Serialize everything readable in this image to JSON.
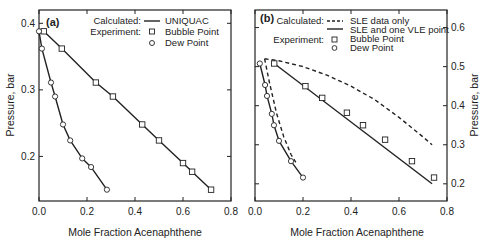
{
  "figure": {
    "background": "#ffffff",
    "ink_color": "#222222"
  },
  "chart_data": [
    {
      "panel_label": "(a)",
      "type": "line",
      "xlabel": "Mole Fraction Acenaphthene",
      "ylabel": "Pressure, bar",
      "ylabel_side": "left",
      "xlim": [
        0.0,
        0.8
      ],
      "ylim": [
        0.133,
        0.42
      ],
      "xticks": [
        0.0,
        0.2,
        0.4,
        0.6,
        0.8
      ],
      "xtick_labels": [
        "0.0",
        "0.2",
        "0.4",
        "0.6",
        "0.8"
      ],
      "yticks": [
        0.2,
        0.3,
        0.4
      ],
      "ytick_labels": [
        "0.2",
        "0.3",
        "0.4"
      ],
      "grid": false,
      "legend": {
        "position": "upper right",
        "rows": [
          {
            "group": "Calculated:",
            "symbol": "solid-line",
            "label": "UNIQUAC"
          },
          {
            "group": "Experiment:",
            "symbol": "square",
            "label": "Bubble Point"
          },
          {
            "group": "",
            "symbol": "circle",
            "label": "Dew Point"
          }
        ]
      },
      "series": [
        {
          "name": "Calculated UNIQUAC bubble curve",
          "style": "solid",
          "x": [
            0.0,
            0.02,
            0.095,
            0.237,
            0.308,
            0.43,
            0.5,
            0.6,
            0.638,
            0.717
          ],
          "y": [
            0.388,
            0.388,
            0.362,
            0.311,
            0.29,
            0.248,
            0.224,
            0.19,
            0.177,
            0.15
          ]
        },
        {
          "name": "Calculated UNIQUAC dew curve",
          "style": "solid",
          "x": [
            0.0,
            0.012,
            0.05,
            0.067,
            0.1,
            0.13,
            0.18,
            0.217,
            0.283
          ],
          "y": [
            0.388,
            0.362,
            0.311,
            0.29,
            0.248,
            0.224,
            0.197,
            0.184,
            0.15
          ]
        },
        {
          "name": "Bubble Point",
          "style": "marker-square",
          "x": [
            0.02,
            0.095,
            0.237,
            0.308,
            0.43,
            0.5,
            0.6,
            0.638,
            0.717
          ],
          "y": [
            0.388,
            0.362,
            0.311,
            0.29,
            0.248,
            0.224,
            0.19,
            0.177,
            0.15
          ]
        },
        {
          "name": "Dew Point",
          "style": "marker-circle",
          "x": [
            0.0,
            0.012,
            0.05,
            0.067,
            0.1,
            0.13,
            0.18,
            0.217,
            0.283
          ],
          "y": [
            0.388,
            0.362,
            0.311,
            0.29,
            0.248,
            0.224,
            0.197,
            0.184,
            0.15
          ]
        }
      ]
    },
    {
      "panel_label": "(b)",
      "type": "line",
      "xlabel": "Mole Fraction Acenaphthene",
      "ylabel": "Pressure, bar",
      "ylabel_side": "right",
      "xlim": [
        0.0,
        0.8
      ],
      "ylim": [
        0.156,
        0.645
      ],
      "xticks": [
        0.0,
        0.2,
        0.4,
        0.6,
        0.8
      ],
      "xtick_labels": [
        "0.0",
        "0.2",
        "0.4",
        "0.6",
        "0.8"
      ],
      "yticks": [
        0.2,
        0.3,
        0.4,
        0.5,
        0.6
      ],
      "ytick_labels": [
        "0.2",
        "0.3",
        "0.4",
        "0.5",
        "0.6"
      ],
      "grid": false,
      "legend": {
        "position": "upper",
        "rows": [
          {
            "group": "Calculated:",
            "symbol": "dashed-line",
            "label": "SLE data only"
          },
          {
            "group": "",
            "symbol": "solid-line",
            "label": "SLE and one VLE point"
          },
          {
            "group": "Experiment:",
            "symbol": "square",
            "label": "Bubble Point"
          },
          {
            "group": "",
            "symbol": "circle",
            "label": "Dew Point"
          }
        ]
      },
      "series": [
        {
          "name": "Calculated SLE data only bubble curve",
          "style": "dashed",
          "x": [
            0.04,
            0.1,
            0.2,
            0.3,
            0.4,
            0.5,
            0.6,
            0.7,
            0.738
          ],
          "y": [
            0.52,
            0.515,
            0.5,
            0.478,
            0.45,
            0.415,
            0.37,
            0.32,
            0.3
          ]
        },
        {
          "name": "Calculated SLE data only dew curve",
          "style": "dashed",
          "x": [
            0.04,
            0.06,
            0.09,
            0.12,
            0.15,
            0.17
          ],
          "y": [
            0.52,
            0.46,
            0.38,
            0.32,
            0.275,
            0.255
          ]
        },
        {
          "name": "Calculated SLE and one VLE point bubble curve",
          "style": "solid",
          "x": [
            0.08,
            0.738
          ],
          "y": [
            0.508,
            0.2
          ]
        },
        {
          "name": "Calculated SLE and one VLE point dew curve",
          "style": "solid",
          "x": [
            0.02,
            0.042,
            0.05,
            0.07,
            0.079,
            0.1,
            0.15,
            0.2
          ],
          "y": [
            0.508,
            0.453,
            0.425,
            0.379,
            0.35,
            0.31,
            0.258,
            0.216
          ]
        },
        {
          "name": "Bubble Point",
          "style": "marker-square",
          "x": [
            0.08,
            0.21,
            0.28,
            0.383,
            0.45,
            0.542,
            0.654,
            0.746
          ],
          "y": [
            0.508,
            0.45,
            0.42,
            0.382,
            0.35,
            0.313,
            0.258,
            0.216
          ]
        },
        {
          "name": "Dew Point",
          "style": "marker-circle",
          "x": [
            0.02,
            0.042,
            0.05,
            0.07,
            0.079,
            0.1,
            0.15,
            0.2
          ],
          "y": [
            0.508,
            0.453,
            0.425,
            0.379,
            0.35,
            0.31,
            0.258,
            0.216
          ]
        }
      ]
    }
  ]
}
